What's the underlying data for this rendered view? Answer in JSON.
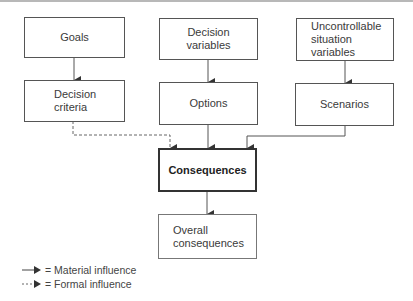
{
  "diagram": {
    "nodes": [
      {
        "id": "goals",
        "label": "Goals"
      },
      {
        "id": "decision_variables",
        "label": "Decision\nvariables"
      },
      {
        "id": "uncontrollable",
        "label": "Uncontrollable\nsituation\nvariables"
      },
      {
        "id": "decision_criteria",
        "label": "Decision\ncriteria"
      },
      {
        "id": "options",
        "label": "Options"
      },
      {
        "id": "scenarios",
        "label": "Scenarios"
      },
      {
        "id": "consequences",
        "label": "Consequences"
      },
      {
        "id": "overall_consequences",
        "label": "Overall\nconsequences"
      }
    ],
    "edges": [
      {
        "from": "goals",
        "to": "decision_criteria",
        "type": "material"
      },
      {
        "from": "decision_variables",
        "to": "options",
        "type": "material"
      },
      {
        "from": "uncontrollable",
        "to": "scenarios",
        "type": "material"
      },
      {
        "from": "decision_criteria",
        "to": "consequences",
        "type": "formal"
      },
      {
        "from": "options",
        "to": "consequences",
        "type": "material"
      },
      {
        "from": "scenarios",
        "to": "consequences",
        "type": "material"
      },
      {
        "from": "consequences",
        "to": "overall_consequences",
        "type": "material"
      }
    ]
  },
  "legend": {
    "material": "= Material influence",
    "formal": "= Formal influence"
  }
}
